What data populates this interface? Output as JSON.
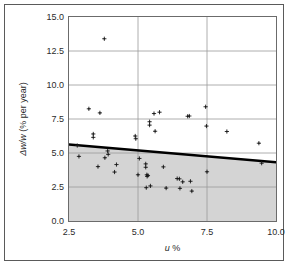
{
  "figure": {
    "border_color": "#5a5a5a",
    "background": "#ffffff"
  },
  "axis": {
    "x_title_prefix": "u",
    "x_title_suffix": " %",
    "y_title_prefix": "Δw/w",
    "y_title_suffix": " (% per year)",
    "x_title_full": "u %",
    "y_title_full": "Δw/w (% per year)"
  },
  "chart_data": {
    "type": "scatter",
    "title": "",
    "subtitle": "",
    "xlabel": "u %",
    "ylabel": "Δw/w (% per year)",
    "xlim": [
      2.5,
      10.0
    ],
    "ylim": [
      0.0,
      15.0
    ],
    "xticks": [
      2.5,
      5.0,
      7.5,
      10.0
    ],
    "yticks": [
      0.0,
      2.5,
      5.0,
      7.5,
      10.0,
      12.5,
      15.0
    ],
    "xtick_labels": [
      "2.5",
      "5.0",
      "7.5",
      "10.0"
    ],
    "ytick_labels": [
      "0.0",
      "2.5",
      "5.0",
      "7.5",
      "10.0",
      "12.5",
      "15.0"
    ],
    "grid": true,
    "grid_color": "#9a9a9a",
    "legend": "none",
    "marker": "plus-cross",
    "marker_color": "#1a1a1a",
    "point_count": 53,
    "points": [
      {
        "x": 2.8,
        "y": 5.55
      },
      {
        "x": 2.86,
        "y": 4.75
      },
      {
        "x": 3.22,
        "y": 8.25
      },
      {
        "x": 3.38,
        "y": 6.4
      },
      {
        "x": 3.38,
        "y": 6.15
      },
      {
        "x": 3.55,
        "y": 4.0
      },
      {
        "x": 3.62,
        "y": 7.95
      },
      {
        "x": 3.78,
        "y": 13.4
      },
      {
        "x": 3.8,
        "y": 4.65
      },
      {
        "x": 3.9,
        "y": 5.15
      },
      {
        "x": 3.92,
        "y": 4.9
      },
      {
        "x": 4.15,
        "y": 3.6
      },
      {
        "x": 4.22,
        "y": 4.15
      },
      {
        "x": 4.9,
        "y": 6.25
      },
      {
        "x": 4.92,
        "y": 6.05
      },
      {
        "x": 5.0,
        "y": 3.4
      },
      {
        "x": 5.05,
        "y": 4.6
      },
      {
        "x": 5.28,
        "y": 4.2
      },
      {
        "x": 5.28,
        "y": 3.95
      },
      {
        "x": 5.32,
        "y": 3.4
      },
      {
        "x": 5.33,
        "y": 3.28
      },
      {
        "x": 5.36,
        "y": 3.35
      },
      {
        "x": 5.3,
        "y": 2.45
      },
      {
        "x": 5.42,
        "y": 7.3
      },
      {
        "x": 5.42,
        "y": 7.05
      },
      {
        "x": 5.45,
        "y": 2.58
      },
      {
        "x": 5.58,
        "y": 7.9
      },
      {
        "x": 5.62,
        "y": 6.6
      },
      {
        "x": 5.78,
        "y": 8.0
      },
      {
        "x": 5.92,
        "y": 3.98
      },
      {
        "x": 6.02,
        "y": 2.42
      },
      {
        "x": 6.42,
        "y": 3.12
      },
      {
        "x": 6.5,
        "y": 3.1
      },
      {
        "x": 6.52,
        "y": 2.4
      },
      {
        "x": 6.62,
        "y": 2.88
      },
      {
        "x": 6.8,
        "y": 7.7
      },
      {
        "x": 6.86,
        "y": 7.72
      },
      {
        "x": 6.9,
        "y": 2.92
      },
      {
        "x": 6.95,
        "y": 2.2
      },
      {
        "x": 7.45,
        "y": 8.4
      },
      {
        "x": 7.48,
        "y": 6.98
      },
      {
        "x": 7.5,
        "y": 3.62
      },
      {
        "x": 8.22,
        "y": 6.58
      },
      {
        "x": 9.38,
        "y": 5.72
      },
      {
        "x": 9.48,
        "y": 4.25
      }
    ],
    "trend_line": {
      "label": "upper bound",
      "color": "#000000",
      "width_px": 2.5,
      "x_start": 2.5,
      "y_start": 5.62,
      "x_end": 10.0,
      "y_end": 4.32
    },
    "shaded_region": {
      "label": "region below bound",
      "fill_color": "#d4d4d4",
      "y_floor": 0.0,
      "description": "grey fill between y=0 and the trend line"
    }
  }
}
